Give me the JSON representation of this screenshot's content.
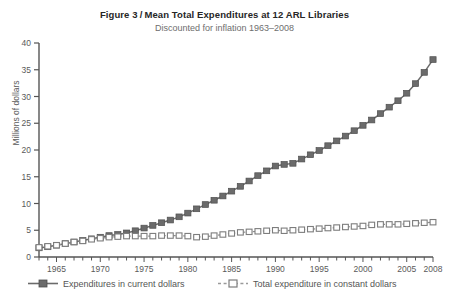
{
  "figure": {
    "number_label": "Figure 3",
    "separator": "/",
    "title": "Mean Total Expenditures at 12 ARL Libraries",
    "subtitle": "Discounted for inflation 1963–2008"
  },
  "axes": {
    "ylabel": "Millions of dollars",
    "xlabel": "",
    "y_ticks": [
      "0",
      "5",
      "10",
      "15",
      "20",
      "25",
      "30",
      "35",
      "40"
    ],
    "x_ticks": [
      "1965",
      "1970",
      "1975",
      "1980",
      "1985",
      "1990",
      "1995",
      "2000",
      "2005",
      "2008"
    ]
  },
  "legend": {
    "current_label": "Expenditures in current dollars",
    "constant_label": "Total expenditure in constant dollars",
    "current_marker": "filled-square-solid-line",
    "constant_marker": "open-square-dashed-line"
  },
  "colors": {
    "series_current": "#6b6b6b",
    "series_constant": "#8f8f8f",
    "axis": "#555555",
    "title": "#262626",
    "subtitle": "#6e6e6e",
    "background": "#ffffff"
  },
  "chart_data": {
    "type": "line",
    "subtitle": "Discounted for inflation 1963–2008",
    "xlabel": "",
    "ylabel": "Millions of dollars",
    "xlim": [
      1963,
      2008
    ],
    "ylim": [
      0,
      40
    ],
    "yticks": [
      0,
      5,
      10,
      15,
      20,
      25,
      30,
      35,
      40
    ],
    "xticks": [
      1965,
      1970,
      1975,
      1980,
      1985,
      1990,
      1995,
      2000,
      2005,
      2008
    ],
    "grid": false,
    "legend_position": "below-axes",
    "x": [
      1963,
      1964,
      1965,
      1966,
      1967,
      1968,
      1969,
      1970,
      1971,
      1972,
      1973,
      1974,
      1975,
      1976,
      1977,
      1978,
      1979,
      1980,
      1981,
      1982,
      1983,
      1984,
      1985,
      1986,
      1987,
      1988,
      1989,
      1990,
      1991,
      1992,
      1993,
      1994,
      1995,
      1996,
      1997,
      1998,
      1999,
      2000,
      2001,
      2002,
      2003,
      2004,
      2005,
      2006,
      2007,
      2008
    ],
    "series": [
      {
        "name": "Expenditures in current dollars",
        "marker": "filled-square",
        "linestyle": "solid",
        "color": "#6b6b6b",
        "values": [
          1.7,
          1.9,
          2.2,
          2.5,
          2.8,
          3.1,
          3.4,
          3.7,
          4.0,
          4.2,
          4.5,
          4.9,
          5.4,
          5.9,
          6.4,
          6.9,
          7.5,
          8.2,
          9.0,
          9.8,
          10.6,
          11.4,
          12.3,
          13.2,
          14.2,
          15.2,
          16.1,
          17.0,
          17.3,
          17.5,
          18.3,
          19.1,
          19.9,
          20.8,
          21.7,
          22.6,
          23.6,
          24.6,
          25.6,
          26.8,
          28.0,
          29.2,
          30.6,
          32.4,
          34.5,
          36.9
        ]
      },
      {
        "name": "Total expenditure in constant dollars",
        "marker": "open-square",
        "linestyle": "dashed",
        "color": "#8f8f8f",
        "values": [
          1.8,
          2.0,
          2.2,
          2.5,
          2.8,
          3.0,
          3.3,
          3.5,
          3.7,
          3.8,
          3.9,
          3.9,
          3.9,
          3.9,
          4.0,
          4.0,
          4.0,
          3.9,
          3.7,
          3.8,
          4.0,
          4.2,
          4.4,
          4.6,
          4.7,
          4.8,
          4.9,
          5.0,
          4.9,
          5.0,
          5.1,
          5.2,
          5.3,
          5.4,
          5.5,
          5.6,
          5.7,
          5.8,
          6.0,
          6.1,
          6.1,
          6.1,
          6.2,
          6.3,
          6.4,
          6.5
        ]
      }
    ]
  }
}
